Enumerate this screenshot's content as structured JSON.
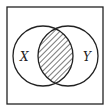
{
  "diagram": {
    "type": "venn",
    "universe": {
      "x": 7,
      "y": 7,
      "width": 96,
      "height": 97
    },
    "sets": [
      {
        "label": "X",
        "cx": 43,
        "cy": 56,
        "r": 30
      },
      {
        "label": "Y",
        "cx": 68,
        "cy": 56,
        "r": 30
      }
    ],
    "shaded_region": "X ∩ Y",
    "shading": "diagonal-hatch",
    "colors": {
      "stroke": "#222222",
      "background": "#ffffff"
    }
  }
}
